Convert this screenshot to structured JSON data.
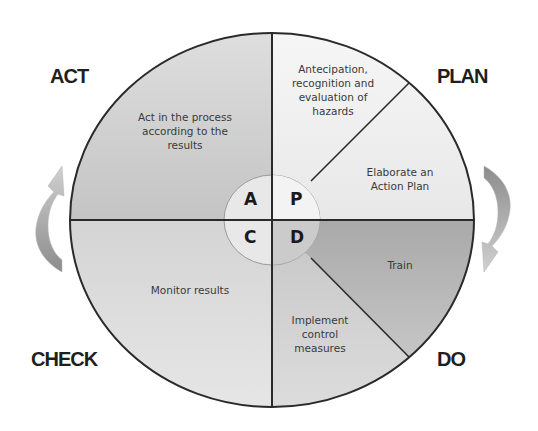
{
  "diagram": {
    "phases": {
      "act": "ACT",
      "plan": "PLAN",
      "do": "DO",
      "check": "CHECK"
    },
    "center_letters": {
      "a": "A",
      "p": "P",
      "c": "C",
      "d": "D"
    },
    "segments": {
      "act": [
        "Act in the process",
        "according to the",
        "results"
      ],
      "plan_1": [
        "Antecipation,",
        "recognition  and",
        "evaluation of",
        "hazards"
      ],
      "plan_2": [
        "Elaborate an",
        "Action Plan"
      ],
      "do_1": [
        "Train"
      ],
      "do_2": [
        "Implement",
        "control",
        "measures"
      ],
      "check": [
        "Monitor results"
      ]
    },
    "colors": {
      "act_fill": "#cfcfcf",
      "plan_fill": "#efefef",
      "do_train_fill": "#b3b3b3",
      "do_implement_fill": "#cccccc",
      "check_fill": "#dadada",
      "inner_circle_fill": "#e6e6e6",
      "outline": "#2a2a2a",
      "arrow_dark": "#8a8a8a",
      "arrow_light": "#c4c4c4"
    },
    "arrows": {
      "left": "cycle-arrow-up",
      "right": "cycle-arrow-down"
    }
  }
}
